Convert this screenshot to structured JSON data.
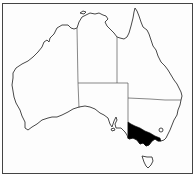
{
  "map": {
    "subject": "Australia",
    "highlighted_region": "Victoria",
    "highlight_color": "#000000",
    "outline_color": "#333333",
    "background_color": "#ffffff",
    "regions": [
      {
        "name": "Western Australia",
        "highlighted": false
      },
      {
        "name": "Northern Territory",
        "highlighted": false
      },
      {
        "name": "South Australia",
        "highlighted": false
      },
      {
        "name": "Queensland",
        "highlighted": false
      },
      {
        "name": "New South Wales",
        "highlighted": false
      },
      {
        "name": "Victoria",
        "highlighted": true
      },
      {
        "name": "Tasmania",
        "highlighted": false
      }
    ]
  }
}
